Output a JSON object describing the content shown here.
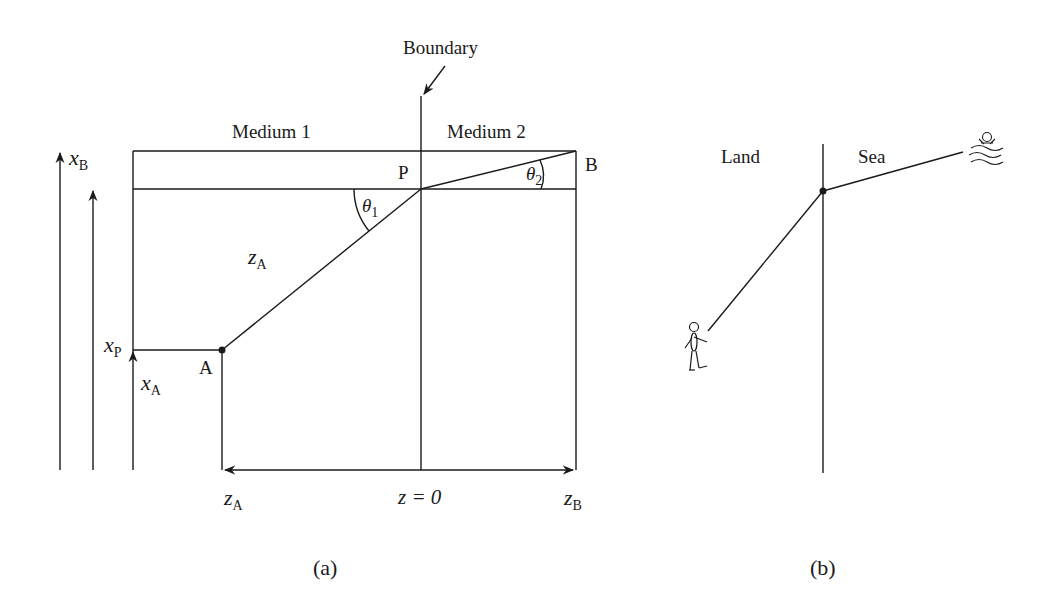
{
  "panel_a": {
    "caption": "(a)",
    "boundary_label": "Boundary",
    "medium1_label": "Medium 1",
    "medium2_label": "Medium 2",
    "point_p": "P",
    "point_a": "A",
    "point_b": "B",
    "theta1": {
      "sym": "θ",
      "sub": "1"
    },
    "theta2": {
      "sym": "θ",
      "sub": "2"
    },
    "x_b": {
      "sym": "x",
      "sub": "B"
    },
    "x_p": {
      "sym": "x",
      "sub": "P"
    },
    "x_a": {
      "sym": "x",
      "sub": "A"
    },
    "z_a_path": {
      "sym": "z",
      "sub": "A"
    },
    "z_a_axis": {
      "sym": "z",
      "sub": "A"
    },
    "z_zero": "z = 0",
    "z_b_axis": {
      "sym": "z",
      "sub": "B"
    }
  },
  "panel_b": {
    "caption": "(b)",
    "land_label": "Land",
    "sea_label": "Sea"
  },
  "colors": {
    "ink": "#1a1a1a",
    "background": "#ffffff"
  }
}
